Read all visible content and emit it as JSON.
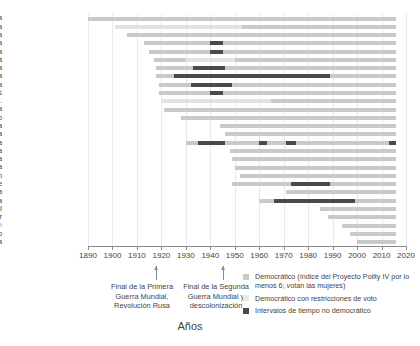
{
  "chart_data": {
    "type": "bar",
    "title": "",
    "xlabel": "Años",
    "ylabel": "",
    "xlim": [
      1890,
      2020
    ],
    "xticks": [
      1890,
      1900,
      1910,
      1920,
      1930,
      1940,
      1950,
      1960,
      1970,
      1980,
      1990,
      2000,
      2010,
      2020
    ],
    "grid": true,
    "legend_position": "bottom-right",
    "categories": [
      "Nueva Zelanda",
      "Australia",
      "Finlandia",
      "Noruega",
      "Dinamarca",
      "Canadá",
      "Austria",
      "Polonia",
      "Alemania",
      "Países Bajos",
      "EE. UU.",
      "Suecia",
      "Reino Unido",
      "Francia",
      "Italia",
      "Turquía",
      "Bélgica",
      "Costa Rica",
      "India",
      "Japón",
      "Chile",
      "Suiza",
      "Nigeria",
      "Brasil",
      "Corea del Sur",
      "Sudáfrica",
      "México",
      "Indonesia"
    ],
    "series": [
      {
        "name": "Nueva Zelanda",
        "segments": [
          {
            "type": "dem",
            "start": 1890,
            "end": 2016
          }
        ]
      },
      {
        "name": "Australia",
        "segments": [
          {
            "type": "restr",
            "start": 1901,
            "end": 1953
          },
          {
            "type": "dem",
            "start": 1953,
            "end": 2016
          }
        ]
      },
      {
        "name": "Finlandia",
        "segments": [
          {
            "type": "dem",
            "start": 1906,
            "end": 2016
          }
        ]
      },
      {
        "name": "Noruega",
        "segments": [
          {
            "type": "dem",
            "start": 1913,
            "end": 1940
          },
          {
            "type": "nodem",
            "start": 1940,
            "end": 1945
          },
          {
            "type": "dem",
            "start": 1945,
            "end": 2016
          }
        ]
      },
      {
        "name": "Dinamarca",
        "segments": [
          {
            "type": "dem",
            "start": 1915,
            "end": 1940
          },
          {
            "type": "nodem",
            "start": 1940,
            "end": 1945
          },
          {
            "type": "dem",
            "start": 1945,
            "end": 2016
          }
        ]
      },
      {
        "name": "Canadá",
        "segments": [
          {
            "type": "dem",
            "start": 1917,
            "end": 1930
          },
          {
            "type": "restr",
            "start": 1930,
            "end": 1950
          },
          {
            "type": "dem",
            "start": 1950,
            "end": 2016
          }
        ]
      },
      {
        "name": "Austria",
        "segments": [
          {
            "type": "dem",
            "start": 1918,
            "end": 1933
          },
          {
            "type": "nodem",
            "start": 1933,
            "end": 1946
          },
          {
            "type": "dem",
            "start": 1946,
            "end": 2016
          }
        ]
      },
      {
        "name": "Polonia",
        "segments": [
          {
            "type": "dem",
            "start": 1918,
            "end": 1925
          },
          {
            "type": "nodem",
            "start": 1925,
            "end": 1989
          },
          {
            "type": "dem",
            "start": 1989,
            "end": 2016
          }
        ]
      },
      {
        "name": "Alemania",
        "segments": [
          {
            "type": "dem",
            "start": 1919,
            "end": 1932
          },
          {
            "type": "nodem",
            "start": 1932,
            "end": 1949
          },
          {
            "type": "dem",
            "start": 1949,
            "end": 2016
          }
        ]
      },
      {
        "name": "Países Bajos",
        "segments": [
          {
            "type": "dem",
            "start": 1919,
            "end": 1940
          },
          {
            "type": "nodem",
            "start": 1940,
            "end": 1945
          },
          {
            "type": "dem",
            "start": 1945,
            "end": 2016
          }
        ]
      },
      {
        "name": "EE. UU.",
        "segments": [
          {
            "type": "restr",
            "start": 1920,
            "end": 1965
          },
          {
            "type": "dem",
            "start": 1965,
            "end": 2016
          }
        ]
      },
      {
        "name": "Suecia",
        "segments": [
          {
            "type": "dem",
            "start": 1921,
            "end": 2016
          }
        ]
      },
      {
        "name": "Reino Unido",
        "segments": [
          {
            "type": "dem",
            "start": 1928,
            "end": 2016
          }
        ]
      },
      {
        "name": "Francia",
        "segments": [
          {
            "type": "dem",
            "start": 1944,
            "end": 2016
          }
        ]
      },
      {
        "name": "Italia",
        "segments": [
          {
            "type": "dem",
            "start": 1946,
            "end": 2016
          }
        ]
      },
      {
        "name": "Turquía",
        "segments": [
          {
            "type": "dem",
            "start": 1930,
            "end": 1935
          },
          {
            "type": "nodem",
            "start": 1935,
            "end": 1946
          },
          {
            "type": "dem",
            "start": 1946,
            "end": 1960
          },
          {
            "type": "nodem",
            "start": 1960,
            "end": 1963
          },
          {
            "type": "dem",
            "start": 1963,
            "end": 1971
          },
          {
            "type": "nodem",
            "start": 1971,
            "end": 1975
          },
          {
            "type": "dem",
            "start": 1975,
            "end": 2013
          },
          {
            "type": "nodem",
            "start": 2013,
            "end": 2016
          }
        ]
      },
      {
        "name": "Bélgica",
        "segments": [
          {
            "type": "dem",
            "start": 1948,
            "end": 2016
          }
        ]
      },
      {
        "name": "Costa Rica",
        "segments": [
          {
            "type": "dem",
            "start": 1949,
            "end": 2016
          }
        ]
      },
      {
        "name": "India",
        "segments": [
          {
            "type": "dem",
            "start": 1950,
            "end": 2016
          }
        ]
      },
      {
        "name": "Japón",
        "segments": [
          {
            "type": "dem",
            "start": 1952,
            "end": 2016
          }
        ]
      },
      {
        "name": "Chile",
        "segments": [
          {
            "type": "dem",
            "start": 1949,
            "end": 1973
          },
          {
            "type": "nodem",
            "start": 1973,
            "end": 1989
          },
          {
            "type": "dem",
            "start": 1989,
            "end": 2016
          }
        ]
      },
      {
        "name": "Suiza",
        "segments": [
          {
            "type": "dem",
            "start": 1971,
            "end": 2016
          }
        ]
      },
      {
        "name": "Nigeria",
        "segments": [
          {
            "type": "dem",
            "start": 1960,
            "end": 1966
          },
          {
            "type": "nodem",
            "start": 1966,
            "end": 1999
          },
          {
            "type": "dem",
            "start": 1999,
            "end": 2016
          }
        ]
      },
      {
        "name": "Brasil",
        "segments": [
          {
            "type": "dem",
            "start": 1985,
            "end": 2016
          }
        ]
      },
      {
        "name": "Corea del Sur",
        "segments": [
          {
            "type": "dem",
            "start": 1988,
            "end": 2016
          }
        ]
      },
      {
        "name": "Sudáfrica",
        "segments": [
          {
            "type": "dem",
            "start": 1994,
            "end": 2016
          }
        ]
      },
      {
        "name": "México",
        "segments": [
          {
            "type": "dem",
            "start": 1997,
            "end": 2016
          }
        ]
      },
      {
        "name": "Indonesia",
        "segments": [
          {
            "type": "dem",
            "start": 2000,
            "end": 2016
          }
        ]
      }
    ],
    "annotations": [
      {
        "id": "wwi",
        "year": 1918,
        "text": "Final de la Primera\nGuerra Mundial,\nRevolución Rusa"
      },
      {
        "id": "wwii",
        "year": 1945,
        "text": "Final de la Segunda\nGuerra Mundial y\ndescolonización"
      }
    ],
    "legend": [
      {
        "key": "dem",
        "color": "#c9c9c9",
        "label": "Democrático (índice del Proyecto Polity IV por lo menos 6; votan las mujeres)"
      },
      {
        "key": "restr",
        "color": "#e8e8e8",
        "label": "Democrático con restricciones de voto"
      },
      {
        "key": "nodem",
        "color": "#4a4a4a",
        "label": "Intervalos de tiempo no democrático"
      }
    ]
  }
}
